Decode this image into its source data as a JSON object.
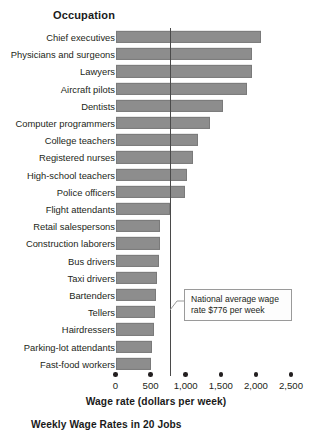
{
  "header": {
    "column_title": "Occupation"
  },
  "callout": {
    "text": "National average wage rate $776 per week"
  },
  "caption": {
    "text": "Weekly Wage Rates in 20 Jobs"
  },
  "colors": {
    "bar_fill": "#8d8d8d",
    "bar_stroke": "#7a7a7a",
    "avg_line": "#4a4a4a",
    "text": "#231f20",
    "background": "#ffffff"
  },
  "chart_data": {
    "type": "bar",
    "orientation": "horizontal",
    "title": "Weekly Wage Rates in 20 Jobs",
    "xlabel": "Wage rate (dollars per week)",
    "ylabel": "Occupation",
    "xlim": [
      0,
      2500
    ],
    "ticks": [
      0,
      500,
      1000,
      1500,
      2000,
      2500
    ],
    "tick_labels": [
      "0",
      "500",
      "1,000",
      "1,500",
      "2,000",
      "2,500"
    ],
    "grid": false,
    "legend": null,
    "annotations": [
      {
        "type": "vline",
        "value": 776,
        "label": "National average wage rate $776 per week"
      }
    ],
    "categories": [
      "Chief executives",
      "Physicians and surgeons",
      "Lawyers",
      "Aircraft pilots",
      "Dentists",
      "Computer programmers",
      "College teachers",
      "Registered nurses",
      "High-school teachers",
      "Police officers",
      "Flight attendants",
      "Retail salespersons",
      "Construction laborers",
      "Bus drivers",
      "Taxi drivers",
      "Bartenders",
      "Tellers",
      "Hairdressers",
      "Parking-lot attendants",
      "Fast-food workers"
    ],
    "values": [
      2075,
      1945,
      1940,
      1880,
      1530,
      1345,
      1175,
      1105,
      1020,
      990,
      775,
      635,
      630,
      620,
      590,
      575,
      560,
      550,
      520,
      505
    ]
  }
}
